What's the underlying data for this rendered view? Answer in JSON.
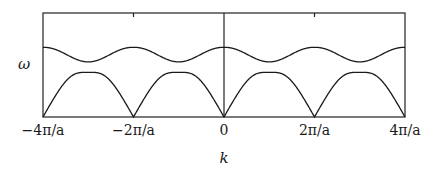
{
  "chart_data": {
    "type": "line",
    "title": "",
    "xlabel": "k",
    "ylabel": "ω",
    "xlim_pi_over_a": [
      -4,
      4
    ],
    "x_ticks": [
      {
        "value": -4,
        "label": "−4π/a"
      },
      {
        "value": -2,
        "label": "−2π/a"
      },
      {
        "value": 0,
        "label": "0"
      },
      {
        "value": 2,
        "label": "2π/a"
      },
      {
        "value": 4,
        "label": "4π/a"
      }
    ],
    "grid": false,
    "legend": null,
    "units_note": "x in units of π/a; y normalized 0 (axis) to 1 (frame top)",
    "series": [
      {
        "name": "lower branch (acoustic)",
        "x": [
          -4,
          -3.5,
          -3,
          -2.5,
          -2,
          -1.5,
          -1,
          -0.5,
          0,
          0.5,
          1,
          1.5,
          2,
          2.5,
          3,
          3.5,
          4
        ],
        "y": [
          0.0,
          0.25,
          0.43,
          0.25,
          0.0,
          0.25,
          0.43,
          0.25,
          0.0,
          0.25,
          0.43,
          0.25,
          0.0,
          0.25,
          0.43,
          0.25,
          0.0
        ]
      },
      {
        "name": "upper branch (optical)",
        "x": [
          -4,
          -3.5,
          -3,
          -2.5,
          -2,
          -1.5,
          -1,
          -0.5,
          0,
          0.5,
          1,
          1.5,
          2,
          2.5,
          3,
          3.5,
          4
        ],
        "y": [
          0.67,
          0.6,
          0.53,
          0.6,
          0.67,
          0.6,
          0.53,
          0.6,
          0.67,
          0.6,
          0.53,
          0.6,
          0.67,
          0.6,
          0.53,
          0.6,
          0.67
        ]
      }
    ]
  },
  "labels": {
    "ylabel": "ω",
    "xlabel": "k",
    "ticks": [
      "−4π/a",
      "−2π/a",
      "0",
      "2π/a",
      "4π/a"
    ]
  }
}
